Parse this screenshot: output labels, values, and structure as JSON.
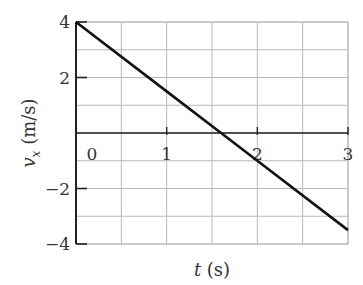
{
  "chart_data": {
    "type": "line",
    "title": "",
    "xlabel": "t (s)",
    "ylabel": "v_x (m/s)",
    "ylabel_parts": {
      "var": "v",
      "sub": "x",
      "unit": " (m/s)"
    },
    "xlabel_parts": {
      "var": "t",
      "unit": " (s)"
    },
    "xlim": [
      0,
      3
    ],
    "ylim": [
      -4,
      4
    ],
    "x_ticks": [
      0,
      1,
      2,
      3
    ],
    "x_tick_labels": [
      "0",
      "1",
      "2",
      "3"
    ],
    "y_ticks": [
      4,
      2,
      -2,
      -4
    ],
    "y_tick_labels": [
      "4",
      "2",
      "−2",
      "−4"
    ],
    "grid": true,
    "grid_x_step": 0.5,
    "grid_y_step": 1,
    "series": [
      {
        "name": "v_x(t)",
        "x": [
          0,
          1,
          1.6,
          2,
          3
        ],
        "y": [
          4,
          1.5,
          0,
          -1,
          -3.5
        ]
      }
    ],
    "legend": null
  }
}
